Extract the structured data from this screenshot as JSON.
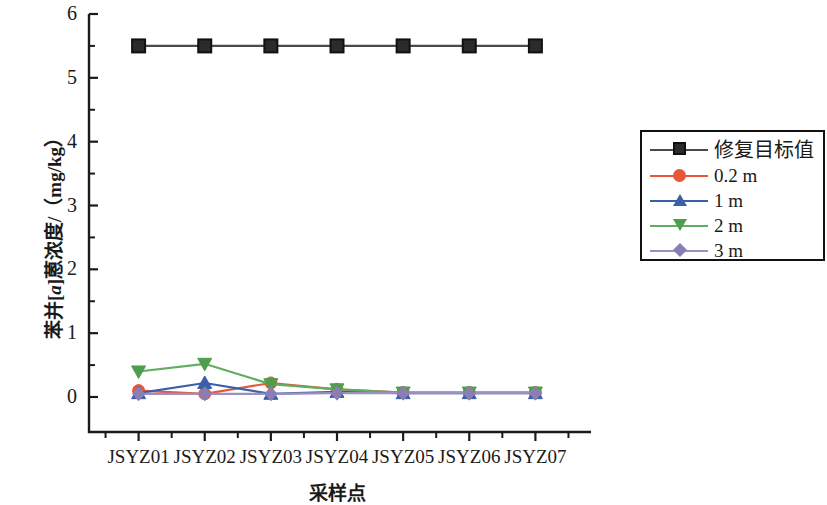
{
  "chart_data": {
    "type": "line",
    "title": "",
    "xlabel": "采样点",
    "ylabel_parts": {
      "pre": "苯并[",
      "ital": "a",
      "post": "]蒽浓度/（mg/kg）"
    },
    "ylabel": "苯并[a]蒽浓度/（mg/kg）",
    "categories": [
      "JSYZ01",
      "JSYZ02",
      "JSYZ03",
      "JSYZ04",
      "JSYZ05",
      "JSYZ06",
      "JSYZ07"
    ],
    "ylim": [
      0,
      6
    ],
    "yticks": [
      0,
      1,
      2,
      3,
      4,
      5,
      6
    ],
    "ytick_labels": [
      "0",
      "1",
      "2",
      "3",
      "4",
      "5",
      "6"
    ],
    "yminor_ticks": [
      0.5,
      1.5,
      2.5,
      3.5,
      4.5,
      5.5
    ],
    "grid": false,
    "legend_position": "right",
    "series": [
      {
        "name": "修复目标值",
        "color": "#4a4a4a",
        "marker": "square",
        "marker_color": "#2b2b2b",
        "values": [
          5.5,
          5.5,
          5.5,
          5.5,
          5.5,
          5.5,
          5.5
        ]
      },
      {
        "name": "0.2 m",
        "color": "#e8563a",
        "marker": "circle",
        "marker_color": "#e8563a",
        "values": [
          0.1,
          0.05,
          0.22,
          0.12,
          0.07,
          0.07,
          0.07
        ]
      },
      {
        "name": "1 m",
        "color": "#3b5fa8",
        "marker": "triangle-up",
        "marker_color": "#3b5fa8",
        "values": [
          0.06,
          0.22,
          0.05,
          0.08,
          0.06,
          0.06,
          0.06
        ]
      },
      {
        "name": "2 m",
        "color": "#5fae5f",
        "marker": "triangle-down",
        "marker_color": "#4e9e4e",
        "values": [
          0.4,
          0.52,
          0.2,
          0.12,
          0.07,
          0.07,
          0.07
        ]
      },
      {
        "name": "3 m",
        "color": "#9a90c2",
        "marker": "diamond",
        "marker_color": "#8a7fb5",
        "values": [
          0.05,
          0.05,
          0.05,
          0.06,
          0.06,
          0.06,
          0.06
        ]
      }
    ]
  },
  "axis": {
    "y_title": "苯并[a]蒽浓度/（mg/kg）",
    "x_title": "采样点"
  },
  "legend": {
    "entries": [
      {
        "label": "修复目标值"
      },
      {
        "label": "0.2 m"
      },
      {
        "label": "1 m"
      },
      {
        "label": "2 m"
      },
      {
        "label": "3 m"
      }
    ]
  }
}
